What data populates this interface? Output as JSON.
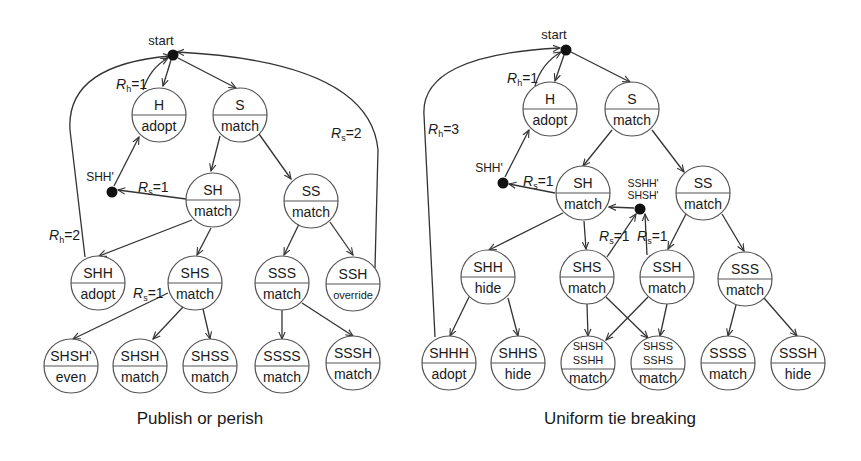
{
  "diagrams": [
    {
      "caption": "Publish or perish",
      "start_label": "start",
      "nodes": {
        "H": {
          "top": "H",
          "bottom": "adopt"
        },
        "S": {
          "top": "S",
          "bottom": "match"
        },
        "SH": {
          "top": "SH",
          "bottom": "match"
        },
        "SS": {
          "top": "SS",
          "bottom": "match"
        },
        "SHH": {
          "top": "SHH",
          "bottom": "adopt"
        },
        "SHS": {
          "top": "SHS",
          "bottom": "match"
        },
        "SSS": {
          "top": "SSS",
          "bottom": "match"
        },
        "SSH": {
          "top": "SSH",
          "bottom": "override"
        },
        "SHSHp": {
          "top": "SHSH'",
          "bottom": "even"
        },
        "SHSH": {
          "top": "SHSH",
          "bottom": "match"
        },
        "SHSS": {
          "top": "SHSS",
          "bottom": "match"
        },
        "SSSS": {
          "top": "SSSS",
          "bottom": "match"
        },
        "SSSH": {
          "top": "SSSH",
          "bottom": "match"
        }
      },
      "dots": {
        "SHHp": "SHH'"
      },
      "edge_labels": {
        "rh1": {
          "var": "R",
          "sub": "h",
          "val": "=1"
        },
        "rs1_sh": {
          "var": "R",
          "sub": "s",
          "val": "=1"
        },
        "rs1_shs": {
          "var": "R",
          "sub": "s",
          "val": "=1"
        },
        "rh2": {
          "var": "R",
          "sub": "h",
          "val": "=2"
        },
        "rs2": {
          "var": "R",
          "sub": "s",
          "val": "=2"
        }
      }
    },
    {
      "caption": "Uniform tie breaking",
      "start_label": "start",
      "nodes": {
        "H": {
          "top": "H",
          "bottom": "adopt"
        },
        "S": {
          "top": "S",
          "bottom": "match"
        },
        "SH": {
          "top": "SH",
          "bottom": "match"
        },
        "SS": {
          "top": "SS",
          "bottom": "match"
        },
        "SHH": {
          "top": "SHH",
          "bottom": "hide"
        },
        "SHS": {
          "top": "SHS",
          "bottom": "match"
        },
        "SSH": {
          "top": "SSH",
          "bottom": "match"
        },
        "SSS": {
          "top": "SSS",
          "bottom": "match"
        },
        "SHHH": {
          "top": "SHHH",
          "bottom": "adopt"
        },
        "SHHS": {
          "top": "SHHS",
          "bottom": "hide"
        },
        "SHSH_SSHH": {
          "top1": "SHSH",
          "top2": "SSHH",
          "bottom": "match"
        },
        "SHSS_SSHS": {
          "top1": "SHSS",
          "top2": "SSHS",
          "bottom": "match"
        },
        "SSSS": {
          "top": "SSSS",
          "bottom": "match"
        },
        "SSSH": {
          "top": "SSSH",
          "bottom": "hide"
        }
      },
      "dots": {
        "SHHp": "SHH'",
        "merge_line1": "SSHH'",
        "merge_line2": "SHSH'"
      },
      "edge_labels": {
        "rh1": {
          "var": "R",
          "sub": "h",
          "val": "=1"
        },
        "rh3": {
          "var": "R",
          "sub": "h",
          "val": "=3"
        },
        "rs1_sh": {
          "var": "R",
          "sub": "s",
          "val": "=1"
        },
        "rs1_shs": {
          "var": "R",
          "sub": "s",
          "val": "=1"
        },
        "rs1_ssh": {
          "var": "R",
          "sub": "s",
          "val": "=1"
        }
      }
    }
  ],
  "colors": {
    "node_stroke": "#555555",
    "edge": "#333333",
    "dot": "#111111",
    "text": "#1a1a1a",
    "background": "#ffffff"
  }
}
